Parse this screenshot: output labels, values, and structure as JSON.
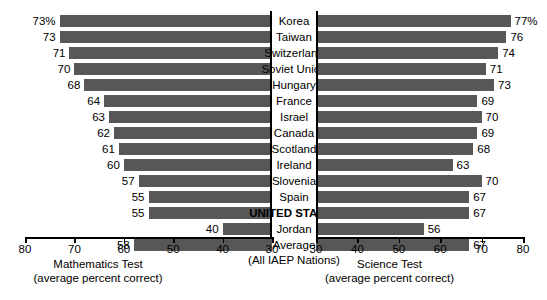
{
  "chart_data": {
    "type": "bar",
    "title": "",
    "orientation": "horizontal-diverging",
    "categories": [
      "Korea",
      "Taiwan",
      "Switzerland",
      "Soviet Union",
      "Hungary",
      "France",
      "Israel",
      "Canada",
      "Scotland",
      "Ireland",
      "Slovenia",
      "Spain",
      "UNITED STATES",
      "Jordan",
      "Average"
    ],
    "category_note": "(All IAEP Nations)",
    "bold_category": "UNITED STATES",
    "series": [
      {
        "name": "Mathematics Test",
        "axis": "left",
        "axis_label": "Mathematics Test",
        "axis_sublabel": "(average percent correct)",
        "xlim": [
          80,
          30
        ],
        "ticks": [
          80,
          70,
          60,
          50,
          40,
          30
        ],
        "values": [
          73,
          73,
          71,
          70,
          68,
          64,
          63,
          62,
          61,
          60,
          57,
          55,
          55,
          40,
          58
        ],
        "labels": [
          "73%",
          "73",
          "71",
          "70",
          "68",
          "64",
          "63",
          "62",
          "61",
          "60",
          "57",
          "55",
          "55",
          "40",
          "58"
        ]
      },
      {
        "name": "Science Test",
        "axis": "right",
        "axis_label": "Science Test",
        "axis_sublabel": "(average percent correct)",
        "xlim": [
          30,
          80
        ],
        "ticks": [
          30,
          40,
          50,
          60,
          70,
          80
        ],
        "values": [
          77,
          76,
          74,
          71,
          73,
          69,
          70,
          69,
          68,
          63,
          70,
          67,
          67,
          56,
          67
        ],
        "labels": [
          "77%",
          "76",
          "74",
          "71",
          "73",
          "69",
          "70",
          "69",
          "68",
          "63",
          "70",
          "67",
          "67",
          "56",
          "67"
        ]
      }
    ],
    "grid": false,
    "legend": "none",
    "colors": {
      "bar": "#575757",
      "axis": "#000000",
      "background": "#ffffff",
      "text": "#000000"
    }
  }
}
